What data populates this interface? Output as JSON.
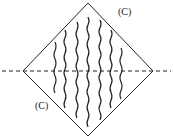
{
  "diagram": {
    "labels": [
      {
        "text": "(C)",
        "x": 118,
        "y": 6
      },
      {
        "text": "(C)",
        "x": 35,
        "y": 100
      }
    ],
    "diamond": {
      "top": [
        88,
        3
      ],
      "right": [
        153,
        71
      ],
      "bottom": [
        88,
        136
      ],
      "left": [
        23,
        71
      ]
    },
    "axis": {
      "y": 71,
      "x1": 2,
      "x2": 171,
      "style": "dashed"
    },
    "waves": [
      {
        "x": 55,
        "y1": 42,
        "y2": 93
      },
      {
        "x": 65,
        "y1": 30,
        "y2": 108
      },
      {
        "x": 77,
        "y1": 22,
        "y2": 118
      },
      {
        "x": 88,
        "y1": 17,
        "y2": 127
      },
      {
        "x": 100,
        "y1": 20,
        "y2": 120
      },
      {
        "x": 111,
        "y1": 30,
        "y2": 108
      },
      {
        "x": 121,
        "y1": 48,
        "y2": 99
      }
    ],
    "colors": {
      "stroke": "#222222"
    }
  }
}
